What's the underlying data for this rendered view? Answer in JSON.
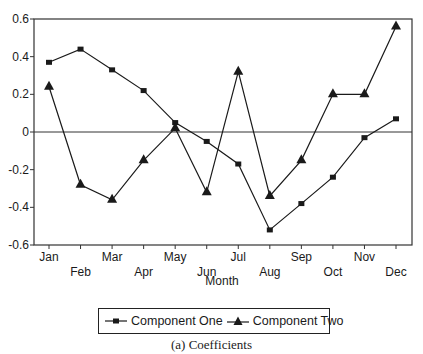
{
  "chart_data": {
    "type": "line",
    "title": "",
    "caption": "(a) Coefficients",
    "xlabel": "Month",
    "ylabel": "",
    "ylim": [
      -0.6,
      0.6
    ],
    "yticks": [
      "0.6",
      "0.4",
      "0.2",
      "0",
      "-0.2",
      "-0.4",
      "-0.6"
    ],
    "ytick_values": [
      0.6,
      0.4,
      0.2,
      0,
      -0.2,
      -0.4,
      -0.6
    ],
    "categories": [
      "Jan",
      "Feb",
      "Mar",
      "Apr",
      "May",
      "Jun",
      "Jul",
      "Aug",
      "Sep",
      "Oct",
      "Nov",
      "Dec"
    ],
    "grid": false,
    "zero_line": true,
    "legend_position": "bottom",
    "series": [
      {
        "name": "Component One",
        "marker": "square",
        "values": [
          0.37,
          0.44,
          0.33,
          0.22,
          0.05,
          -0.05,
          -0.17,
          -0.52,
          -0.38,
          -0.24,
          -0.03,
          0.07
        ]
      },
      {
        "name": "Component Two",
        "marker": "triangle",
        "values": [
          0.24,
          -0.28,
          -0.36,
          -0.15,
          0.02,
          -0.32,
          0.32,
          -0.34,
          -0.15,
          0.2,
          0.2,
          0.56
        ]
      }
    ]
  },
  "legend": {
    "items": [
      "Component One",
      "Component Two"
    ]
  },
  "colors": {
    "line": "#1a1a1a",
    "axis": "#333333",
    "background": "#ffffff"
  }
}
